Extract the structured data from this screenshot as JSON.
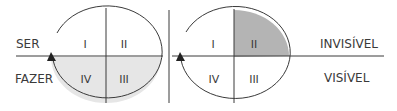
{
  "left_diagram": {
    "labels": {
      "top": "SER",
      "bottom": "FAZER"
    },
    "quadrants": {
      "q1": "I",
      "q2": "II",
      "q3": "III",
      "q4": "IV"
    },
    "shaded_region": "bottom-half",
    "shade_color": "#e6e6e6"
  },
  "right_diagram": {
    "labels": {
      "top": "INVISÍVEL",
      "bottom": "VISÍVEL"
    },
    "quadrants": {
      "q1": "I",
      "q2": "II",
      "q3": "III",
      "q4": "IV"
    },
    "shaded_region": "quadrant-II",
    "shade_color": "#b4b4b4"
  },
  "colors": {
    "line": "#3a3a3a",
    "text": "#3a3a3a"
  }
}
